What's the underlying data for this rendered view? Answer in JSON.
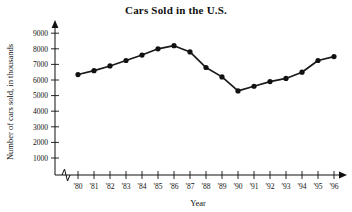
{
  "chart_data": {
    "type": "line",
    "title": "Cars Sold in the U.S.",
    "xlabel": "Year",
    "ylabel": "Number of cars sold, in thousands",
    "categories": [
      "'80",
      "'81",
      "'82",
      "'83",
      "'84",
      "'85",
      "'86",
      "'87",
      "'88",
      "'89",
      "'90",
      "'91",
      "'92",
      "'93",
      "'94",
      "'95",
      "'96"
    ],
    "values": [
      6350,
      6600,
      6900,
      7250,
      7600,
      8000,
      8200,
      7800,
      6800,
      6200,
      5300,
      5600,
      5900,
      6100,
      6500,
      7250,
      7500
    ],
    "yticks": [
      1000,
      2000,
      3000,
      4000,
      5000,
      6000,
      7000,
      8000,
      9000
    ],
    "ytick_labels": [
      "1000",
      "2000",
      "3000",
      "4000",
      "5000",
      "6000",
      "7000",
      "8000",
      "9000"
    ],
    "ylim": [
      0,
      9600
    ],
    "grid": false,
    "legend": null,
    "marker": "filled-circle",
    "x_axis_break": true,
    "series_name": "Cars sold"
  },
  "axes": {
    "x_axis_label": "Year",
    "y_axis_label": "Number of cars sold, in thousands"
  }
}
